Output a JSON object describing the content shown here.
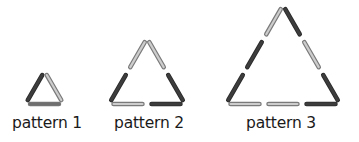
{
  "colors": {
    "dark": "#3d3d3d",
    "medium": "#6f6f6f",
    "light": "#cdcdcd",
    "outline": "#7a7a7a"
  },
  "patterns": [
    {
      "label": "pattern 1",
      "side_length_sticks": 1,
      "sticks": {
        "left": [
          "dark"
        ],
        "right": [
          "light"
        ],
        "bottom": [
          "medium"
        ]
      }
    },
    {
      "label": "pattern 2",
      "side_length_sticks": 2,
      "sticks": {
        "left": [
          "dark",
          "light"
        ],
        "right": [
          "light",
          "dark"
        ],
        "bottom": [
          "light",
          "dark"
        ]
      }
    },
    {
      "label": "pattern 3",
      "side_length_sticks": 3,
      "sticks": {
        "left": [
          "dark",
          "dark",
          "light"
        ],
        "right": [
          "dark",
          "light",
          "dark"
        ],
        "bottom": [
          "light",
          "light",
          "dark"
        ]
      }
    }
  ]
}
